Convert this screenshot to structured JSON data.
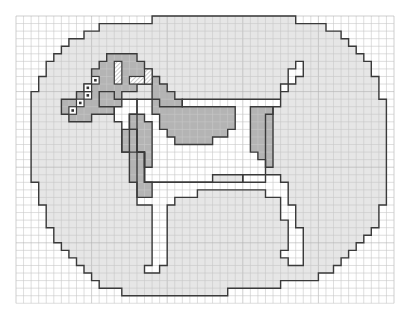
{
  "pattern": {
    "title": "Dog cross-stitch grid chart",
    "grid": {
      "x0": 16,
      "y0": 16,
      "cols": 50,
      "rows": 38,
      "cell": 7.56,
      "line_color": "#c8c8c8",
      "major_every": 10,
      "major_color": "#b0b0b0"
    },
    "colors": {
      "background": "#ffffff",
      "light": "#e6e6e6",
      "dark": "#b4b4b4",
      "white": "#ffffff",
      "outline": "#3a3a3a",
      "hatch": "#bdbdbd"
    },
    "shapes": [
      {
        "name": "oval-background",
        "fill": "light",
        "points": [
          [
            30,
            0
          ],
          [
            37,
            0
          ],
          [
            37,
            1
          ],
          [
            41,
            1
          ],
          [
            41,
            2
          ],
          [
            43,
            2
          ],
          [
            43,
            3
          ],
          [
            44,
            3
          ],
          [
            44,
            4
          ],
          [
            45,
            4
          ],
          [
            45,
            5
          ],
          [
            46,
            5
          ],
          [
            46,
            6
          ],
          [
            47,
            6
          ],
          [
            47,
            8
          ],
          [
            48,
            8
          ],
          [
            48,
            11
          ],
          [
            49,
            11
          ],
          [
            49,
            25
          ],
          [
            48,
            25
          ],
          [
            48,
            28
          ],
          [
            47,
            28
          ],
          [
            47,
            29
          ],
          [
            46,
            29
          ],
          [
            46,
            30
          ],
          [
            45,
            30
          ],
          [
            45,
            31
          ],
          [
            44,
            31
          ],
          [
            44,
            32
          ],
          [
            43,
            32
          ],
          [
            43,
            33
          ],
          [
            42,
            33
          ],
          [
            42,
            34
          ],
          [
            40,
            34
          ],
          [
            40,
            35
          ],
          [
            35,
            35
          ],
          [
            35,
            36
          ],
          [
            28,
            36
          ],
          [
            28,
            37
          ],
          [
            14,
            37
          ],
          [
            14,
            36
          ],
          [
            11,
            36
          ],
          [
            11,
            35
          ],
          [
            10,
            35
          ],
          [
            10,
            34
          ],
          [
            9,
            34
          ],
          [
            9,
            33
          ],
          [
            8,
            33
          ],
          [
            8,
            32
          ],
          [
            7,
            32
          ],
          [
            7,
            31
          ],
          [
            6,
            31
          ],
          [
            6,
            30
          ],
          [
            5,
            30
          ],
          [
            5,
            28
          ],
          [
            4,
            28
          ],
          [
            4,
            25
          ],
          [
            3,
            25
          ],
          [
            3,
            22
          ],
          [
            2,
            22
          ],
          [
            2,
            10
          ],
          [
            3,
            10
          ],
          [
            3,
            8
          ],
          [
            4,
            8
          ],
          [
            4,
            6
          ],
          [
            5,
            6
          ],
          [
            5,
            5
          ],
          [
            6,
            5
          ],
          [
            6,
            4
          ],
          [
            7,
            4
          ],
          [
            7,
            3
          ],
          [
            9,
            3
          ],
          [
            9,
            2
          ],
          [
            11,
            2
          ],
          [
            11,
            1
          ],
          [
            18,
            1
          ],
          [
            18,
            0
          ]
        ]
      },
      {
        "name": "dog-body-white",
        "fill": "white",
        "points": [
          [
            11,
            10
          ],
          [
            13,
            10
          ],
          [
            13,
            11
          ],
          [
            16,
            11
          ],
          [
            16,
            13
          ],
          [
            15,
            13
          ],
          [
            15,
            18
          ],
          [
            17,
            18
          ],
          [
            17,
            22
          ],
          [
            30,
            22
          ],
          [
            30,
            21
          ],
          [
            35,
            21
          ],
          [
            35,
            22
          ],
          [
            36,
            22
          ],
          [
            36,
            25
          ],
          [
            37,
            25
          ],
          [
            37,
            28
          ],
          [
            38,
            28
          ],
          [
            38,
            30
          ],
          [
            38,
            33
          ],
          [
            36,
            33
          ],
          [
            36,
            32
          ],
          [
            35,
            32
          ],
          [
            35,
            31
          ],
          [
            36,
            31
          ],
          [
            36,
            27
          ],
          [
            35,
            27
          ],
          [
            35,
            24
          ],
          [
            33,
            24
          ],
          [
            33,
            23
          ],
          [
            24,
            23
          ],
          [
            24,
            24
          ],
          [
            21,
            24
          ],
          [
            21,
            25
          ],
          [
            20,
            25
          ],
          [
            20,
            33
          ],
          [
            19,
            33
          ],
          [
            19,
            34
          ],
          [
            17,
            34
          ],
          [
            17,
            33
          ],
          [
            18,
            33
          ],
          [
            18,
            32
          ],
          [
            18,
            25
          ],
          [
            16,
            25
          ],
          [
            16,
            18
          ],
          [
            14,
            18
          ],
          [
            14,
            14
          ],
          [
            13,
            14
          ],
          [
            13,
            12
          ],
          [
            11,
            12
          ]
        ]
      },
      {
        "name": "dog-back-white",
        "fill": "white",
        "points": [
          [
            16,
            11
          ],
          [
            19,
            11
          ],
          [
            19,
            12
          ],
          [
            22,
            12
          ],
          [
            22,
            11
          ],
          [
            35,
            11
          ],
          [
            35,
            9
          ],
          [
            36,
            9
          ],
          [
            36,
            7
          ],
          [
            37,
            7
          ],
          [
            37,
            6
          ],
          [
            38,
            6
          ],
          [
            38,
            8
          ],
          [
            37,
            8
          ],
          [
            37,
            9
          ],
          [
            36,
            9
          ],
          [
            36,
            10
          ],
          [
            35,
            10
          ],
          [
            35,
            12
          ],
          [
            34,
            12
          ],
          [
            34,
            13
          ],
          [
            33,
            13
          ],
          [
            33,
            22
          ],
          [
            30,
            22
          ],
          [
            30,
            21
          ],
          [
            26,
            21
          ],
          [
            26,
            22
          ],
          [
            17,
            22
          ],
          [
            17,
            18
          ],
          [
            16,
            18
          ]
        ]
      },
      {
        "name": "head-dark",
        "fill": "dark",
        "points": [
          [
            12,
            5
          ],
          [
            16,
            5
          ],
          [
            16,
            6
          ],
          [
            17,
            6
          ],
          [
            17,
            7
          ],
          [
            18,
            7
          ],
          [
            18,
            9
          ],
          [
            16,
            9
          ],
          [
            16,
            10
          ],
          [
            14,
            10
          ],
          [
            14,
            12
          ],
          [
            13,
            12
          ],
          [
            13,
            13
          ],
          [
            10,
            13
          ],
          [
            10,
            14
          ],
          [
            7,
            14
          ],
          [
            7,
            13
          ],
          [
            6,
            13
          ],
          [
            6,
            11
          ],
          [
            8,
            11
          ],
          [
            8,
            10
          ],
          [
            9,
            10
          ],
          [
            9,
            9
          ],
          [
            10,
            9
          ],
          [
            10,
            7
          ],
          [
            11,
            7
          ],
          [
            11,
            6
          ],
          [
            12,
            6
          ]
        ]
      },
      {
        "name": "ear-dark-neck",
        "fill": "dark",
        "points": [
          [
            18,
            8
          ],
          [
            19,
            8
          ],
          [
            19,
            9
          ],
          [
            20,
            9
          ],
          [
            20,
            10
          ],
          [
            21,
            10
          ],
          [
            21,
            11
          ],
          [
            22,
            11
          ],
          [
            22,
            12
          ],
          [
            29,
            12
          ],
          [
            29,
            15
          ],
          [
            28,
            15
          ],
          [
            28,
            16
          ],
          [
            26,
            16
          ],
          [
            26,
            17
          ],
          [
            21,
            17
          ],
          [
            21,
            16
          ],
          [
            20,
            16
          ],
          [
            20,
            15
          ],
          [
            19,
            15
          ],
          [
            19,
            13
          ],
          [
            18,
            13
          ]
        ]
      },
      {
        "name": "chest-dark",
        "fill": "dark",
        "points": [
          [
            15,
            13
          ],
          [
            17,
            13
          ],
          [
            17,
            14
          ],
          [
            18,
            14
          ],
          [
            18,
            20
          ],
          [
            17,
            20
          ],
          [
            17,
            18
          ],
          [
            16,
            18
          ],
          [
            16,
            15
          ],
          [
            15,
            15
          ]
        ]
      },
      {
        "name": "leg-dark",
        "fill": "dark",
        "points": [
          [
            15,
            15
          ],
          [
            16,
            15
          ],
          [
            16,
            18
          ],
          [
            17,
            18
          ],
          [
            17,
            22
          ],
          [
            18,
            22
          ],
          [
            18,
            24
          ],
          [
            16,
            24
          ],
          [
            16,
            22
          ],
          [
            15,
            22
          ],
          [
            15,
            18
          ],
          [
            14,
            18
          ],
          [
            14,
            15
          ]
        ]
      },
      {
        "name": "rear-dark",
        "fill": "dark",
        "points": [
          [
            31,
            12
          ],
          [
            34,
            12
          ],
          [
            34,
            20
          ],
          [
            33,
            20
          ],
          [
            33,
            19
          ],
          [
            32,
            19
          ],
          [
            32,
            18
          ],
          [
            31,
            18
          ]
        ]
      }
    ],
    "hatched": [
      [
        13,
        6,
        1,
        3
      ],
      [
        15,
        8,
        2,
        1
      ],
      [
        17,
        7,
        1,
        2
      ]
    ],
    "dotted": [
      [
        7,
        12
      ],
      [
        8,
        11
      ],
      [
        9,
        10
      ],
      [
        9,
        9
      ],
      [
        10,
        8
      ]
    ]
  }
}
